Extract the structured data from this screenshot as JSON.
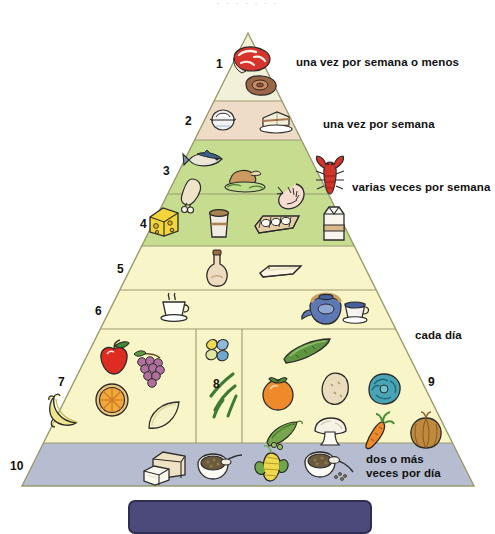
{
  "page": {
    "top_partial_text": "· ·   ·      ·    ·        ·  ·",
    "background_color": "#ffffff"
  },
  "pyramid": {
    "apex": {
      "x": 248,
      "y": 33
    },
    "base": {
      "left_x": 22,
      "right_x": 474,
      "y": 486
    },
    "levels": [
      {
        "number": "1",
        "number_x": 216,
        "number_y": 58,
        "y_top": 33,
        "y_bottom": 101,
        "fill": "#f2f0d8",
        "label": "una vez por semana o menos",
        "label_x": 296,
        "label_y": 55,
        "foods": [
          "steak-icon",
          "ham-slice-icon"
        ]
      },
      {
        "number": "2",
        "number_x": 185,
        "number_y": 115,
        "y_top": 101,
        "y_bottom": 140,
        "fill": "#eedcc6",
        "label": "una vez por semana",
        "label_x": 323,
        "label_y": 117,
        "foods": [
          "rice-bowl-icon",
          "cake-slice-icon"
        ]
      },
      {
        "number": "3",
        "number_x": 163,
        "number_y": 168,
        "y_top": 140,
        "y_bottom": 194,
        "fill": "#c6dd90",
        "label": "varias veces por semana",
        "label_x": 352,
        "label_y": 184,
        "foods": [
          "fish-icon",
          "chicken-drumstick-icon",
          "roast-turkey-icon",
          "shrimp-icon",
          "lobster-icon"
        ]
      },
      {
        "number": "4",
        "number_x": 140,
        "number_y": 221,
        "y_top": 194,
        "y_bottom": 246,
        "fill": "#c6dd90",
        "label": "",
        "label_x": 0,
        "label_y": 0,
        "foods": [
          "cheese-icon",
          "yogurt-cup-icon",
          "egg-carton-icon",
          "milk-carton-icon"
        ]
      },
      {
        "number": "5",
        "number_x": 117,
        "number_y": 265,
        "y_top": 246,
        "y_bottom": 290,
        "fill": "#f8f5c8",
        "label": "",
        "label_x": 0,
        "label_y": 0,
        "foods": [
          "oil-bottle-icon",
          "butter-stick-icon"
        ]
      },
      {
        "number": "6",
        "number_x": 95,
        "number_y": 307,
        "y_top": 290,
        "y_bottom": 329,
        "fill": "#f8f5c8",
        "label": "cada día",
        "label_x": 415,
        "label_y": 332,
        "foods": [
          "coffee-cup-icon",
          "teapot-icon",
          "tea-cup-icon"
        ]
      },
      {
        "number": "7",
        "number_x": 58,
        "number_y": 379,
        "y_top": 329,
        "y_bottom": 443,
        "fill": "#f8f5c8",
        "label": "",
        "label_x": 0,
        "label_y": 0,
        "foods": [
          "apple-icon",
          "grapes-icon",
          "orange-slice-icon",
          "banana-icon",
          "melon-slice-icon"
        ]
      },
      {
        "number": "8",
        "number_x": 213,
        "number_y": 381,
        "y_top": 329,
        "y_bottom": 443,
        "fill": "#f8f5c8",
        "label": "",
        "label_x": 0,
        "label_y": 0,
        "foods": [
          "beans-icon",
          "green-beans-icon"
        ]
      },
      {
        "number": "9",
        "number_x": 428,
        "number_y": 379,
        "y_top": 329,
        "y_bottom": 443,
        "fill": "#f8f5c8",
        "label": "",
        "label_x": 0,
        "label_y": 0,
        "foods": [
          "cucumber-icon",
          "tomato-icon",
          "potato-icon",
          "cabbage-icon",
          "pea-pod-icon",
          "mushroom-icon",
          "carrot-icon",
          "onion-icon"
        ]
      },
      {
        "number": "10",
        "number_x": 12,
        "number_y": 463,
        "y_top": 443,
        "y_bottom": 486,
        "fill": "#b7bdd0",
        "label": "dos o más\nveces por día",
        "label_x": 366,
        "label_y": 455,
        "foods": [
          "bread-loaf-icon",
          "cereal-bowl-icon",
          "corn-cob-icon",
          "grain-bowl-icon"
        ]
      }
    ],
    "dividers": {
      "section_7_8_x": 196,
      "section_8_9_x": 242,
      "y_top": 329,
      "y_bottom": 443
    },
    "outline_color": "#9a9a6e",
    "base_band_color": "#b7bdd0"
  },
  "footer": {
    "bar_color": "#4b4a7a",
    "bar_border": "#2e2d52"
  }
}
